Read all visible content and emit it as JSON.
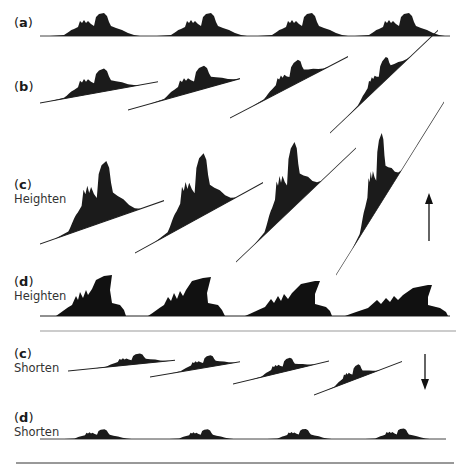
{
  "rows": [
    {
      "id": "a",
      "letter": "a",
      "sublabel": "",
      "label_top": 16
    },
    {
      "id": "b",
      "letter": "b",
      "sublabel": "",
      "label_top": 80
    },
    {
      "id": "c-heighten",
      "letter": "c",
      "sublabel": "Heighten",
      "label_top": 176
    },
    {
      "id": "d-heighten",
      "letter": "d",
      "sublabel": "Heighten",
      "label_top": 275
    },
    {
      "id": "c-shorten",
      "letter": "c",
      "sublabel": "Shorten",
      "label_top": 345
    },
    {
      "id": "d-shorten",
      "letter": "d",
      "sublabel": "Shorten",
      "label_top": 408
    }
  ],
  "arrows": {
    "heighten": {
      "direction": "up"
    },
    "shorten": {
      "direction": "down"
    }
  },
  "colors": {
    "ink": "#111111",
    "separator": "#999999"
  }
}
